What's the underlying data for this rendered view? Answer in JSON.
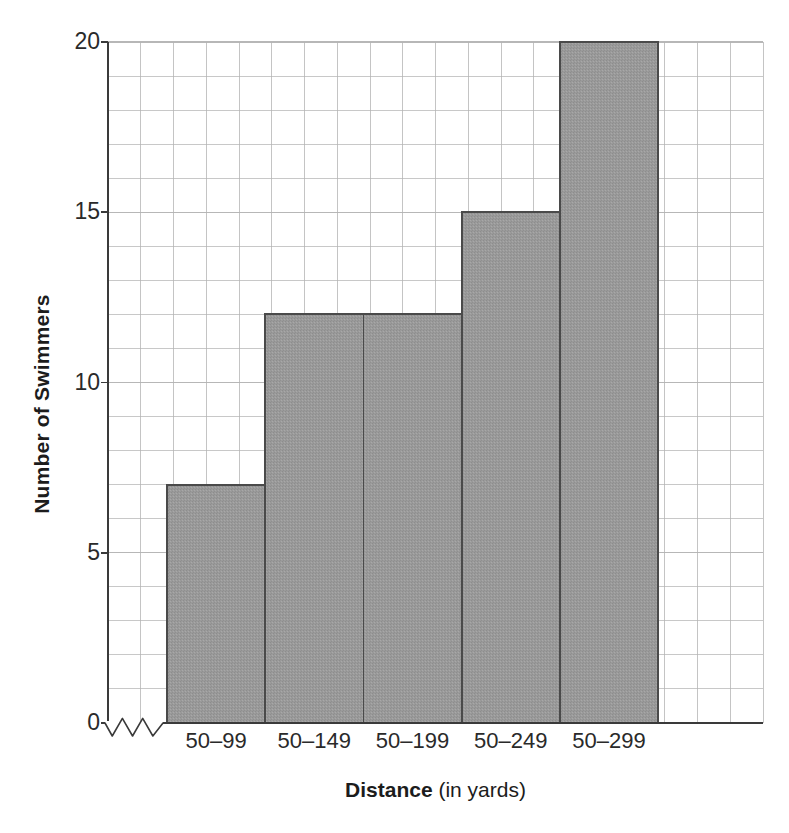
{
  "chart_data": {
    "type": "bar",
    "title": "",
    "subtitle": "",
    "xlabel_bold": "Distance",
    "xlabel_rest": "(in yards)",
    "ylabel": "Number of Swimmers",
    "categories": [
      "50–99",
      "50–149",
      "50–199",
      "50–249",
      "50–299"
    ],
    "values": [
      7,
      12,
      12,
      15,
      20
    ],
    "ylim": [
      0,
      20
    ],
    "xlim_units": [
      0,
      20
    ],
    "y_ticks": [
      0,
      5,
      10,
      15,
      20
    ],
    "y_tick_labels": [
      "0",
      "5",
      "10",
      "15",
      "20"
    ],
    "grid": "on",
    "grid_minor_step_y": 1,
    "grid_minor_step_x": 1,
    "legend": "none",
    "axis_break": "zigzag-on-x-axis-near-origin",
    "bar_fill_color": "#9a9a9a",
    "bar_edge_color": "#4a4a4a",
    "grid_color": "#b4b4b4",
    "axis_color": "#3a3a3a",
    "background_color": "#ffffff",
    "annotations": []
  },
  "figure": {
    "plot": {
      "left_px": 108,
      "top_px": 42,
      "width_px": 655,
      "height_px": 681,
      "unit_px_y": 34.05,
      "unit_px_x": 32.75,
      "bar_start_unit": 1.8,
      "bar_width_units": 3.0
    }
  }
}
